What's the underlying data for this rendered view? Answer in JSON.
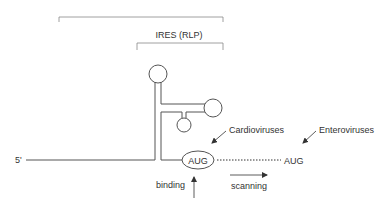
{
  "diagram": {
    "labels": {
      "ires": "IRES (RLP)",
      "five_prime": "5'",
      "aug_start": "AUG",
      "aug_downstream": "AUG",
      "cardioviruses": "Cardioviruses",
      "enteroviruses": "Enteroviruses",
      "scanning": "scanning",
      "binding": "binding"
    },
    "colors": {
      "line": "#555555",
      "text": "#333333",
      "bracket": "#888888"
    }
  }
}
